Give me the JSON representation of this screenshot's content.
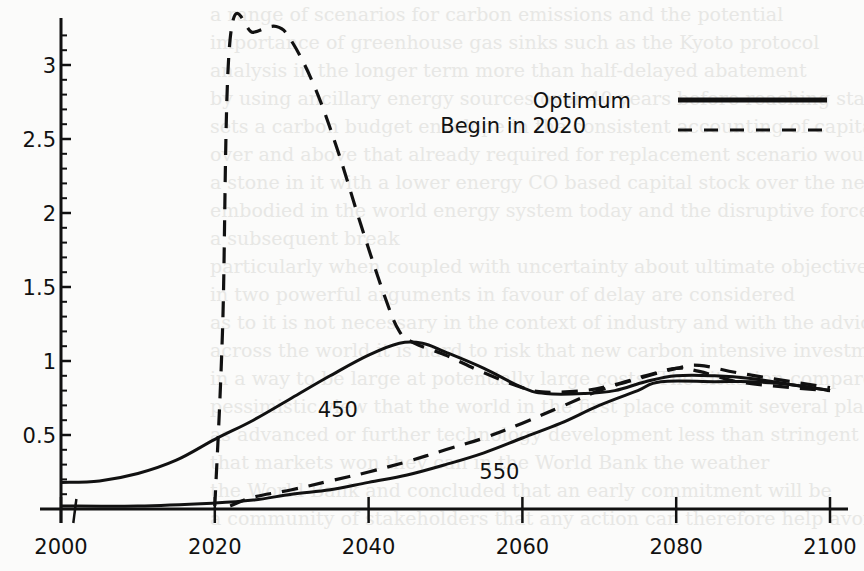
{
  "chart_data": {
    "type": "line",
    "title": "",
    "xlabel": "",
    "ylabel": "",
    "xlim": [
      2000,
      2100
    ],
    "ylim": [
      0,
      3.3
    ],
    "x_ticks": [
      2000,
      2020,
      2040,
      2060,
      2080,
      2100
    ],
    "x_tick_labels": [
      "2000",
      "2020",
      "2040",
      "2060",
      "2080",
      "2100"
    ],
    "y_ticks": [
      0.5,
      1,
      1.5,
      2,
      2.5,
      3
    ],
    "y_tick_labels": [
      "0.5",
      "1",
      "1.5",
      "2",
      "2.5",
      "3"
    ],
    "y_minor_tick_step": 0.1,
    "grid": false,
    "legend": {
      "position": "upper right",
      "entries": [
        {
          "label": "Optimum",
          "style": "solid"
        },
        {
          "label": "Begin  in 2020",
          "style": "dashed"
        }
      ]
    },
    "annotations": [
      {
        "text": "450",
        "x": 2036,
        "y": 0.62
      },
      {
        "text": "550",
        "x": 2057,
        "y": 0.2
      }
    ],
    "series": [
      {
        "name": "450 Optimum",
        "style": "solid",
        "x": [
          2000,
          2005,
          2010,
          2015,
          2020,
          2025,
          2030,
          2035,
          2040,
          2044,
          2047,
          2050,
          2055,
          2060,
          2063,
          2068,
          2072,
          2076,
          2080,
          2085,
          2090,
          2095,
          2100
        ],
        "values": [
          0.18,
          0.19,
          0.24,
          0.33,
          0.47,
          0.6,
          0.75,
          0.9,
          1.04,
          1.12,
          1.12,
          1.06,
          0.95,
          0.82,
          0.78,
          0.78,
          0.8,
          0.86,
          0.9,
          0.9,
          0.88,
          0.84,
          0.8
        ]
      },
      {
        "name": "450 Begin in 2020",
        "style": "dashed",
        "x": [
          2020,
          2021,
          2022,
          2025,
          2028,
          2030,
          2033,
          2036,
          2039,
          2042,
          2044,
          2046,
          2050,
          2055,
          2060,
          2063,
          2068,
          2072,
          2076,
          2080,
          2083,
          2088,
          2095,
          2100
        ],
        "values": [
          0.02,
          1.2,
          3.18,
          3.22,
          3.26,
          3.16,
          2.85,
          2.42,
          1.92,
          1.45,
          1.2,
          1.12,
          1.04,
          0.92,
          0.82,
          0.79,
          0.8,
          0.84,
          0.9,
          0.95,
          0.93,
          0.86,
          0.82,
          0.8
        ]
      },
      {
        "name": "550 Optimum",
        "style": "solid",
        "x": [
          2000,
          2010,
          2020,
          2025,
          2030,
          2035,
          2040,
          2045,
          2050,
          2055,
          2060,
          2065,
          2070,
          2075,
          2078,
          2085,
          2090,
          2095,
          2100
        ],
        "values": [
          0.02,
          0.02,
          0.04,
          0.06,
          0.1,
          0.13,
          0.18,
          0.23,
          0.3,
          0.38,
          0.48,
          0.58,
          0.7,
          0.8,
          0.86,
          0.86,
          0.86,
          0.84,
          0.8
        ]
      },
      {
        "name": "550 Begin in 2020",
        "style": "dashed",
        "x": [
          2022,
          2025,
          2030,
          2035,
          2040,
          2045,
          2050,
          2055,
          2060,
          2065,
          2070,
          2075,
          2080,
          2083,
          2088,
          2095,
          2100
        ],
        "values": [
          0.02,
          0.08,
          0.13,
          0.19,
          0.25,
          0.32,
          0.4,
          0.48,
          0.58,
          0.69,
          0.8,
          0.88,
          0.95,
          0.97,
          0.92,
          0.86,
          0.82
        ]
      }
    ]
  },
  "background_bleed_text": [
    "a range of scenarios for carbon emissions and the potential",
    "importance of greenhouse gas sinks such as the Kyoto protocol",
    "analysis in the longer term more than half-delayed abatement",
    "by using ancillary energy sources over 40 years before reaching stability",
    "sets a carbon budget envelope in the consistent accounting of capital stock",
    "over and above that already required for replacement scenario would be",
    "a stone in it with a lower energy CO based capital stock over the next few decades",
    "embodied in the world energy system today and the disruptive force",
    "a subsequent break",
    "",
    "particularly when coupled with uncertainty about ultimate objectives (see text)",
    "in two powerful arguments in favour of delay are considered",
    "as to it is not necessary in the context of industry and with the advice possible",
    "across the world it is hard to risk that new carbon intensive investments",
    "in a way to be large at potentially large costs. The situation compared with the",
    "pessimistic view that the world in the first place commit several plans or prices",
    "as advanced or further technology development less than stringent targets",
    "that markets won they can in the World Bank the weather",
    "the World Bank and concluded that an early commitment will be",
    "a community of stakeholders that any action can therefore help avoid the world"
  ]
}
